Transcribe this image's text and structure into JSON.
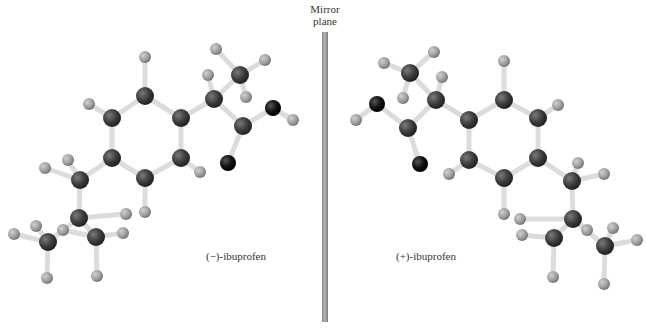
{
  "mirror": {
    "label_line1": "Mirror",
    "label_line2": "plane"
  },
  "molecules": [
    {
      "name": "(−)-ibuprofen",
      "side": "left"
    },
    {
      "name": "(+)-ibuprofen",
      "side": "right"
    }
  ],
  "colors": {
    "carbon": "#3d3d3d",
    "oxygen": "#111111",
    "hydrogen": "#9a9a9a",
    "bond": "#dcdcdc",
    "mirror": "#9a9a9a"
  },
  "footer": {
    "caption_fragment": "Figure"
  }
}
